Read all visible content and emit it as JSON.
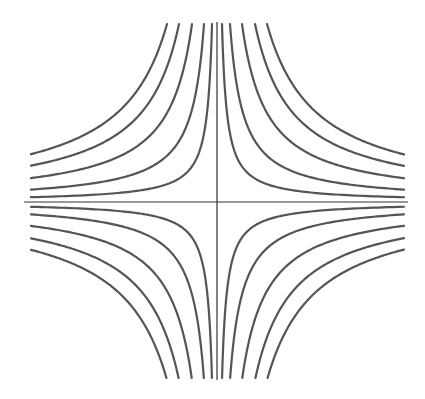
{
  "chart_data": {
    "type": "line",
    "title": "",
    "xlabel": "",
    "ylabel": "",
    "grid": false,
    "legend": null,
    "center_px": [
      217,
      202
    ],
    "x_extent_px": [
      -186,
      187
    ],
    "y_extent_px": [
      -178,
      176
    ],
    "axis_extent_px": {
      "x": [
        24,
        408
      ],
      "y": [
        22,
        380
      ]
    },
    "levels_px2": [
      890,
      2314,
      4450,
      6764,
      8900
    ],
    "quadrants": [
      "I",
      "II",
      "III",
      "IV"
    ],
    "line_color": "#555555",
    "axis_color": "#333333"
  }
}
